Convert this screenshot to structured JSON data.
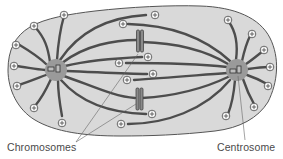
{
  "diagram": {
    "labels": {
      "chromosomes": "Chromosomes",
      "centrosome": "Centrosome"
    },
    "colors": {
      "cell_fill": "#d9d9d9",
      "cell_outline": "#555555",
      "fiber": "#4d4d4d",
      "centrosome_fill": "#9a9a9a",
      "plus_end_fill": "#ffffff",
      "leader_line": "#666666",
      "label_text": "#4a4a4a"
    },
    "components": {
      "cell": "cell-body",
      "centrosomes": [
        "left-centrosome",
        "right-centrosome"
      ],
      "chromosomes": [
        "upper-chromosome",
        "lower-chromosome"
      ],
      "microtubule_plus_end_marker": "⊕"
    }
  }
}
